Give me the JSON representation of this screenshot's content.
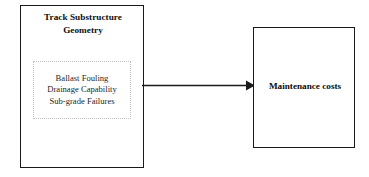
{
  "diagram": {
    "type": "flow-diagram",
    "background_color": "#ffffff",
    "line_color": "#1a1a1a",
    "dotted_border_color": "#c2c2c2",
    "nodes": [
      {
        "id": "substructure",
        "title_line_1": "Track Substructure",
        "title_line_2": "Geometry",
        "shape": "rectangle",
        "border_style": "solid"
      },
      {
        "id": "factors",
        "shape": "rectangle",
        "border_style": "dotted",
        "items": [
          "Ballast Fouling",
          "Drainage Capability",
          "Sub-grade Failures"
        ]
      },
      {
        "id": "maintenance",
        "label": "Maintenance costs",
        "shape": "rectangle",
        "border_style": "solid"
      }
    ],
    "edges": [
      {
        "id": "substructure-to-maintenance",
        "from": "substructure",
        "to": "maintenance",
        "style": "solid",
        "arrowhead": "filled-triangle",
        "direction": "right"
      }
    ]
  }
}
